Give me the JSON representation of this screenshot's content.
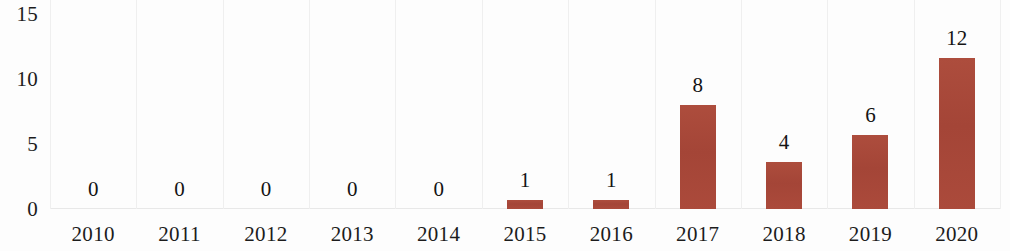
{
  "chart_data": {
    "type": "bar",
    "title": "",
    "subtitle": "",
    "xlabel": "",
    "ylabel": "",
    "categories": [
      "2010",
      "2011",
      "2012",
      "2013",
      "2014",
      "2015",
      "2016",
      "2017",
      "2018",
      "2019",
      "2020"
    ],
    "values": [
      0,
      0,
      0,
      0,
      0,
      1,
      1,
      8,
      4,
      6,
      12
    ],
    "data_labels": [
      "0",
      "0",
      "0",
      "0",
      "0",
      "1",
      "1",
      "8",
      "4",
      "6",
      "12"
    ],
    "bar_plot_values": [
      0,
      0,
      0,
      0,
      0,
      0.7,
      0.7,
      8,
      3.6,
      5.7,
      11.6
    ],
    "ylim": [
      0,
      15
    ],
    "y_ticks": [
      0,
      5,
      10,
      15
    ],
    "y_tick_labels": [
      "0",
      "5",
      "10",
      "15"
    ],
    "grid": "vertical-only",
    "legend": "none",
    "series": [
      {
        "name": "",
        "color": "#a9483a",
        "values": [
          0,
          0,
          0,
          0,
          0,
          1,
          1,
          8,
          4,
          6,
          12
        ]
      }
    ],
    "colors": {
      "bar": "#a9483a",
      "gridline": "#efefef",
      "text": "#1c1c1c",
      "background": "#fdfdfd"
    }
  }
}
